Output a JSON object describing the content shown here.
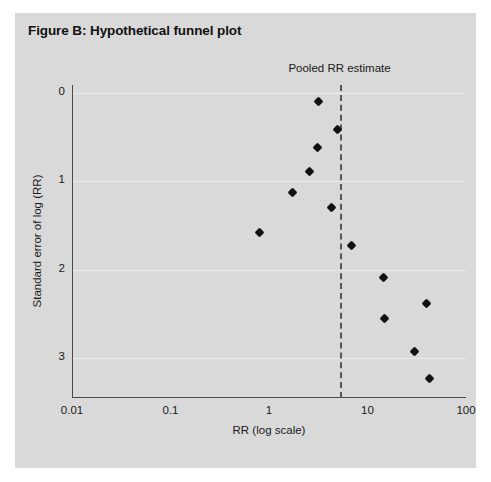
{
  "figure": {
    "title": "Figure B: Hypothetical funnel plot",
    "background_color": "#d9d9d9",
    "page_background": "#ffffff"
  },
  "annotations": {
    "pooled_estimate_label": "Pooled RR estimate",
    "pooled_estimate_value": 5.2,
    "pooled_line_style": "dashed",
    "pooled_line_color": "#555555"
  },
  "chart_data": {
    "type": "scatter",
    "title": "Figure B: Hypothetical funnel plot",
    "xlabel": "RR (log scale)",
    "ylabel": "Standard error of log (RR)",
    "xscale": "log",
    "xlim": [
      0.01,
      100
    ],
    "ylim": [
      0,
      3.45
    ],
    "y_inverted": true,
    "grid": true,
    "legend": null,
    "xticks": [
      0.01,
      0.1,
      1,
      10,
      100
    ],
    "xtick_labels": [
      "0.01",
      "0.1",
      "1",
      "10",
      "100"
    ],
    "yticks": [
      0,
      1,
      2,
      3
    ],
    "ytick_labels": [
      "0",
      "1",
      "2",
      "3"
    ],
    "marker": "diamond",
    "marker_color": "#111111",
    "points": [
      {
        "x": 3.2,
        "y": 0.1
      },
      {
        "x": 5.0,
        "y": 0.41
      },
      {
        "x": 3.1,
        "y": 0.62
      },
      {
        "x": 2.55,
        "y": 0.89
      },
      {
        "x": 1.75,
        "y": 1.12
      },
      {
        "x": 0.8,
        "y": 1.58
      },
      {
        "x": 4.3,
        "y": 1.3
      },
      {
        "x": 6.8,
        "y": 1.72
      },
      {
        "x": 14.5,
        "y": 2.09
      },
      {
        "x": 15.0,
        "y": 2.55
      },
      {
        "x": 40.0,
        "y": 2.38
      },
      {
        "x": 30.0,
        "y": 2.92
      },
      {
        "x": 43.0,
        "y": 3.23
      }
    ],
    "annotations": [
      {
        "text": "Pooled RR estimate",
        "x": 5.2,
        "type": "vline-label"
      }
    ]
  },
  "axis": {
    "x_title": "RR (log scale)",
    "y_title": "Standard error of log (RR)"
  }
}
